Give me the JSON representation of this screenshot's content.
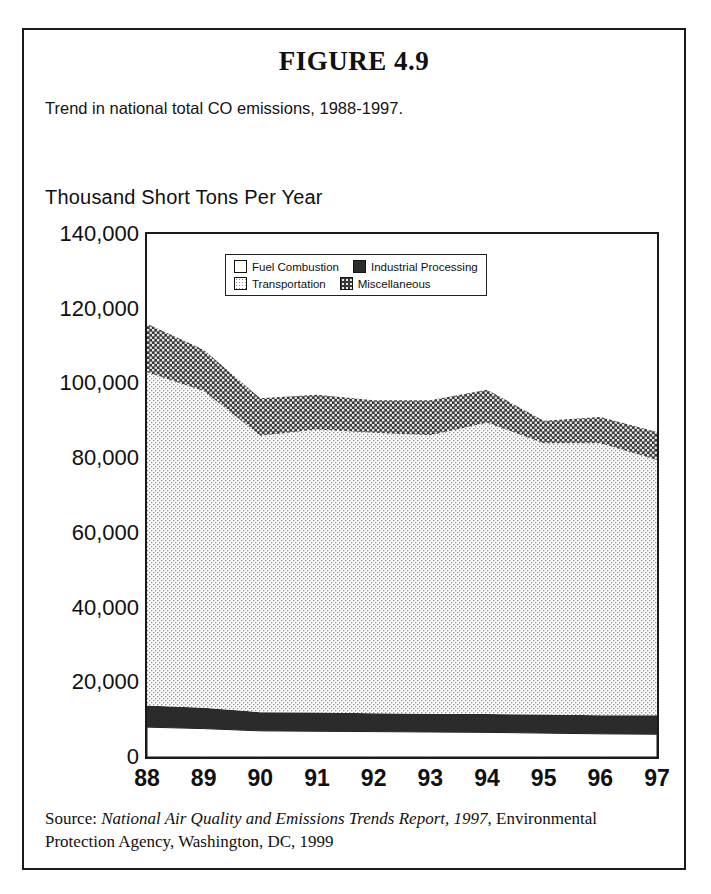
{
  "figure": {
    "title": "FIGURE 4.9",
    "subtitle": "Trend in national total CO emissions, 1988-1997."
  },
  "source": {
    "prefix": "Source: ",
    "italic_part": "National Air Quality and Emissions Trends Report, 1997",
    "rest": ", Environmental Protection Agency, Washington, DC, 1999"
  },
  "colors": {
    "fuel_combustion": "#ffffff",
    "industrial_processing": "#2b2b2b",
    "transportation": "#e2e2e2",
    "miscellaneous": "#6e6e6e",
    "frame": "#1a1a1a",
    "text": "#101010"
  },
  "chart_data": {
    "type": "area",
    "stacked": true,
    "title": "Trend in national total CO emissions, 1988-1997.",
    "xlabel": "",
    "ylabel": "Thousand Short Tons Per Year",
    "x": [
      88,
      89,
      90,
      91,
      92,
      93,
      94,
      95,
      96,
      97
    ],
    "categories": [
      "88",
      "89",
      "90",
      "91",
      "92",
      "93",
      "94",
      "95",
      "96",
      "97"
    ],
    "ytick_labels": [
      "0",
      "20,000",
      "40,000",
      "60,000",
      "80,000",
      "100,000",
      "120,000",
      "140,000"
    ],
    "ytick_values": [
      0,
      20000,
      40000,
      60000,
      80000,
      100000,
      120000,
      140000
    ],
    "ylim": [
      0,
      140000
    ],
    "xlim": [
      88,
      97
    ],
    "grid": false,
    "legend_position": "top-center-inside",
    "series": [
      {
        "name": "Fuel Combustion",
        "fill": "#ffffff",
        "pattern": "solid-white",
        "values": [
          8000,
          7600,
          7000,
          6900,
          6800,
          6700,
          6600,
          6400,
          6200,
          6100
        ]
      },
      {
        "name": "Industrial Processing",
        "fill": "#2b2b2b",
        "pattern": "solid-black",
        "values": [
          5800,
          5600,
          5000,
          5000,
          4900,
          4900,
          4900,
          5000,
          5000,
          5100
        ]
      },
      {
        "name": "Transportation",
        "fill": "#e2e2e2",
        "pattern": "light-dots",
        "values": [
          89200,
          84800,
          74000,
          75800,
          75100,
          74500,
          78000,
          72600,
          72800,
          68300
        ]
      },
      {
        "name": "Miscellaneous",
        "fill": "#6e6e6e",
        "pattern": "dark-crosshatch",
        "values": [
          13000,
          11000,
          10000,
          9300,
          8700,
          9400,
          8800,
          6000,
          7000,
          7500
        ]
      }
    ],
    "totals": [
      116000,
      109000,
      96000,
      97000,
      95500,
      95500,
      98300,
      90000,
      91000,
      87000
    ]
  }
}
